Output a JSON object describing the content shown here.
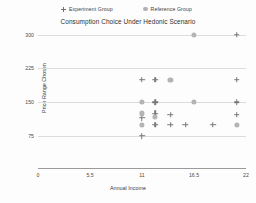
{
  "legend": {
    "position": "top",
    "items": [
      {
        "label": "Experiment Group",
        "marker": "plus-marker-icon",
        "color": "#6f6f6f"
      },
      {
        "label": "Reference Group",
        "marker": "circle-marker-icon",
        "color": "#b0b0b0"
      }
    ]
  },
  "chart_data": {
    "type": "scatter",
    "title": "Consumption Choice Under Hedonic Scenario",
    "xlabel": "Annual Income",
    "ylabel": "Price Range Chosen",
    "xlim": [
      0,
      22
    ],
    "ylim": [
      55,
      310
    ],
    "xticks": [
      0,
      5.5,
      11,
      16.5,
      22
    ],
    "xtick_labels": [
      "0",
      "5.5",
      "11",
      "16.5",
      "22"
    ],
    "yticks": [
      75,
      150,
      225,
      300
    ],
    "ytick_labels": [
      "75",
      "150",
      "225",
      "300"
    ],
    "grid": "horizontal",
    "series": [
      {
        "name": "Experiment Group",
        "marker": "plus",
        "color": "#787878",
        "points": [
          {
            "x": 21.0,
            "y": 300
          },
          {
            "x": 11.0,
            "y": 200
          },
          {
            "x": 12.4,
            "y": 200
          },
          {
            "x": 21.0,
            "y": 200
          },
          {
            "x": 12.4,
            "y": 150
          },
          {
            "x": 21.0,
            "y": 150
          },
          {
            "x": 11.0,
            "y": 115
          },
          {
            "x": 12.4,
            "y": 125
          },
          {
            "x": 14.0,
            "y": 122
          },
          {
            "x": 21.0,
            "y": 122
          },
          {
            "x": 12.4,
            "y": 100
          },
          {
            "x": 14.0,
            "y": 100
          },
          {
            "x": 15.6,
            "y": 100
          },
          {
            "x": 18.5,
            "y": 100
          },
          {
            "x": 11.0,
            "y": 75
          }
        ]
      },
      {
        "name": "Reference Group",
        "marker": "circle",
        "color": "#b4b4b4",
        "points": [
          {
            "x": 16.5,
            "y": 300
          },
          {
            "x": 14.0,
            "y": 200
          },
          {
            "x": 11.0,
            "y": 150
          },
          {
            "x": 16.5,
            "y": 150
          },
          {
            "x": 11.0,
            "y": 125
          },
          {
            "x": 12.4,
            "y": 118
          },
          {
            "x": 11.0,
            "y": 100
          },
          {
            "x": 21.0,
            "y": 100
          }
        ]
      }
    ]
  }
}
